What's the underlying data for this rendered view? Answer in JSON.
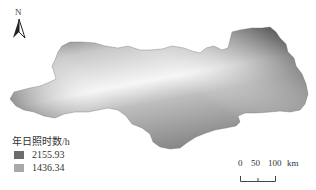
{
  "north_arrow": {
    "label": "N"
  },
  "legend": {
    "title": "年日照时数/h",
    "max_value": "2155.93",
    "min_value": "1436.34",
    "max_color": "#6a6a6a",
    "min_color": "#a8a8a8"
  },
  "scale_bar": {
    "ticks": [
      "0",
      "50",
      "100"
    ],
    "unit": "km"
  },
  "map": {
    "gradient_colors": {
      "dark": "#555555",
      "mid": "#8c8c8c",
      "light": "#f4f4f4"
    }
  }
}
